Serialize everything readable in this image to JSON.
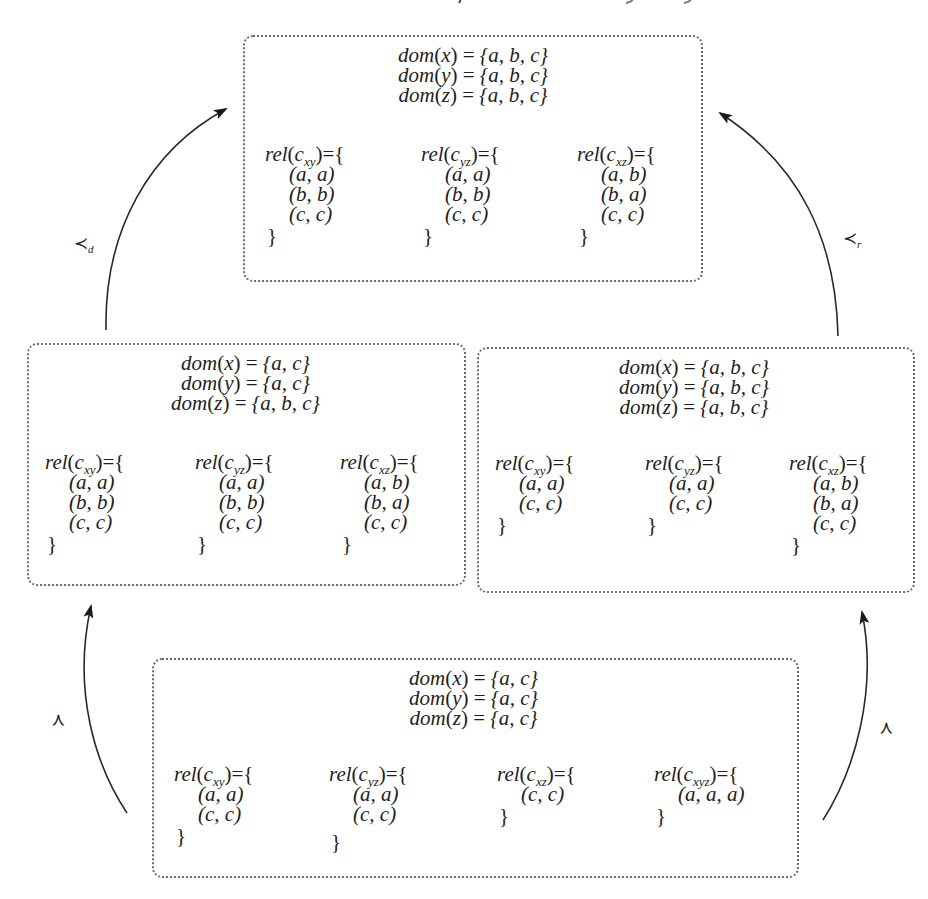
{
  "diagram": {
    "type": "state-lattice",
    "description_visible": "cut-off line of text at top edge (illegible)",
    "states": {
      "top": {
        "domains": [
          {
            "var": "x",
            "values": "{a, b, c}"
          },
          {
            "var": "y",
            "values": "{a, b, c}"
          },
          {
            "var": "z",
            "values": "{a, b, c}"
          }
        ],
        "relations": [
          {
            "constraint": "xy",
            "tuples": [
              "a, a",
              "b, b",
              "c, c"
            ]
          },
          {
            "constraint": "yz",
            "tuples": [
              "a, a",
              "b, b",
              "c, c"
            ]
          },
          {
            "constraint": "xz",
            "tuples": [
              "a, b",
              "b, a",
              "c, c"
            ]
          }
        ]
      },
      "middle_left": {
        "domains": [
          {
            "var": "x",
            "values": "{a, c}"
          },
          {
            "var": "y",
            "values": "{a, c}"
          },
          {
            "var": "z",
            "values": "{a, b, c}"
          }
        ],
        "relations": [
          {
            "constraint": "xy",
            "tuples": [
              "a, a",
              "b, b",
              "c, c"
            ]
          },
          {
            "constraint": "yz",
            "tuples": [
              "a, a",
              "b, b",
              "c, c"
            ]
          },
          {
            "constraint": "xz",
            "tuples": [
              "a, b",
              "b, a",
              "c, c"
            ]
          }
        ]
      },
      "middle_right": {
        "domains": [
          {
            "var": "x",
            "values": "{a, b, c}"
          },
          {
            "var": "y",
            "values": "{a, b, c}"
          },
          {
            "var": "z",
            "values": "{a, b, c}"
          }
        ],
        "relations": [
          {
            "constraint": "xy",
            "tuples": [
              "a, a",
              "c, c"
            ]
          },
          {
            "constraint": "yz",
            "tuples": [
              "a, a",
              "c, c"
            ]
          },
          {
            "constraint": "xz",
            "tuples": [
              "a, b",
              "b, a",
              "c, c"
            ]
          }
        ]
      },
      "bottom": {
        "domains": [
          {
            "var": "x",
            "values": "{a, c}"
          },
          {
            "var": "y",
            "values": "{a, c}"
          },
          {
            "var": "z",
            "values": "{a, c}"
          }
        ],
        "relations": [
          {
            "constraint": "xy",
            "tuples": [
              "a, a",
              "c, c"
            ]
          },
          {
            "constraint": "yz",
            "tuples": [
              "a, a",
              "c, c"
            ]
          },
          {
            "constraint": "xz",
            "tuples": [
              "c, c"
            ]
          },
          {
            "constraint": "xyz",
            "tuples": [
              "a, a, a"
            ]
          }
        ]
      }
    },
    "labels": {
      "dom_fn": "dom",
      "rel_fn": "rel",
      "constraint_prefix": "c",
      "equals": "=",
      "open_brace": "={",
      "close_brace": "}"
    },
    "edges": [
      {
        "from": "middle_left",
        "to": "top",
        "label": "≺",
        "subscript": "d"
      },
      {
        "from": "middle_right",
        "to": "top",
        "label": "≺",
        "subscript": "r"
      },
      {
        "from": "bottom",
        "to": "middle_left",
        "label": "≺",
        "subscript": ""
      },
      {
        "from": "bottom",
        "to": "middle_right",
        "label": "≺",
        "subscript": ""
      }
    ],
    "colors": {
      "line": "#2a2a2a",
      "box_border": "#6a6a6a",
      "text": "#1e1e1e"
    }
  }
}
